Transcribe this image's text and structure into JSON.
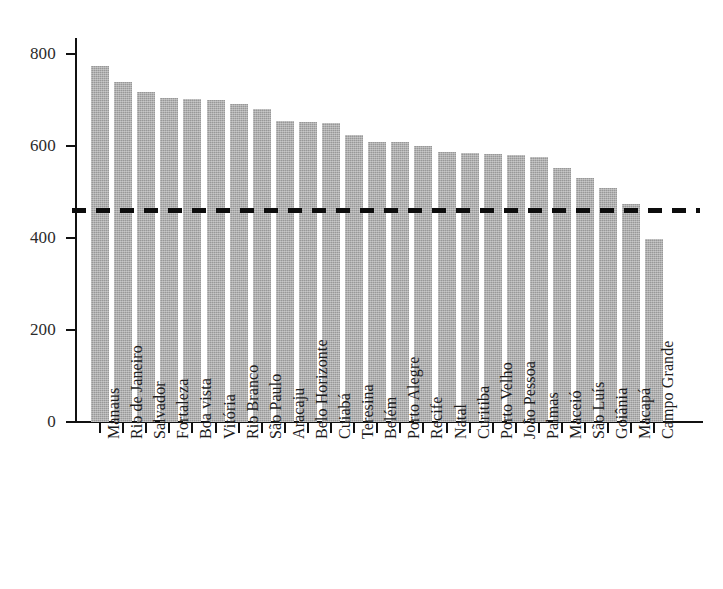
{
  "chart_data": {
    "type": "bar",
    "title": "",
    "subtitle": "",
    "xlabel": "",
    "ylabel": "",
    "ylim": [
      0,
      830
    ],
    "y_ticks": [
      0,
      200,
      400,
      600,
      800
    ],
    "grid": false,
    "legend": null,
    "bar_color": "#989898",
    "orientation": "vertical",
    "categories": [
      "Manaus",
      "Rio de Janeiro",
      "Salvador",
      "Fortaleza",
      "Boa vista",
      "Vitória",
      "Rio Branco",
      "São Paulo",
      "Aracaju",
      "Belo Horizonte",
      "Cuiabá",
      "Teresina",
      "Belém",
      "Porto Alegre",
      "Recife",
      "Natal",
      "Curitiba",
      "Porto Velho",
      "João Pessoa",
      "Palmas",
      "Maceió",
      "São Luís",
      "Goiânia",
      "Macapá",
      "Campo Grande"
    ],
    "values": [
      775,
      740,
      718,
      705,
      703,
      700,
      692,
      680,
      655,
      653,
      650,
      625,
      608,
      608,
      600,
      588,
      585,
      583,
      580,
      577,
      553,
      530,
      508,
      475,
      398
    ],
    "annotations": [
      {
        "name": "reference-line",
        "type": "horizontal-dashed-line",
        "value": 460,
        "color": "#0d0d0d",
        "style": "dashed"
      }
    ]
  }
}
